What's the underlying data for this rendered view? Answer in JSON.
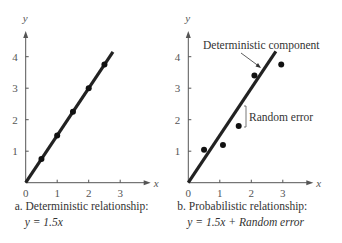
{
  "chart_data": [
    {
      "type": "scatter",
      "title": "",
      "caption_line1": "a. Deterministic relationship:",
      "caption_line2": "y = 1.5x",
      "xlabel": "x",
      "ylabel": "y",
      "xticks": [
        "0",
        "1",
        "2",
        "3"
      ],
      "yticks": [
        "1",
        "2",
        "3",
        "4"
      ],
      "xlim": [
        0,
        3.8
      ],
      "ylim": [
        0,
        4.8
      ],
      "grid": false,
      "line": {
        "slope": 1.5,
        "intercept": 0,
        "x_end": 2.77
      },
      "points": [
        {
          "x": 0.5,
          "y": 0.75
        },
        {
          "x": 1.0,
          "y": 1.5
        },
        {
          "x": 1.5,
          "y": 2.25
        },
        {
          "x": 2.0,
          "y": 3.0
        },
        {
          "x": 2.5,
          "y": 3.75
        }
      ]
    },
    {
      "type": "scatter",
      "title": "",
      "caption_line1": "b. Probabilistic relationship:",
      "caption_line2": "y = 1.5x + Random error",
      "xlabel": "x",
      "ylabel": "y",
      "xticks": [
        "0",
        "1",
        "2",
        "3"
      ],
      "yticks": [
        "1",
        "2",
        "3",
        "4"
      ],
      "xlim": [
        0,
        3.8
      ],
      "ylim": [
        0,
        4.8
      ],
      "grid": false,
      "line": {
        "slope": 1.5,
        "intercept": 0,
        "x_end": 2.78
      },
      "points": [
        {
          "x": 0.5,
          "y": 1.05
        },
        {
          "x": 1.1,
          "y": 1.2
        },
        {
          "x": 1.6,
          "y": 1.8
        },
        {
          "x": 2.1,
          "y": 3.4
        },
        {
          "x": 2.95,
          "y": 3.75
        }
      ],
      "annotations": [
        {
          "text": "Deterministic component",
          "points_to": "regression line"
        },
        {
          "text": "Random error",
          "marker": "bracket"
        }
      ]
    }
  ]
}
